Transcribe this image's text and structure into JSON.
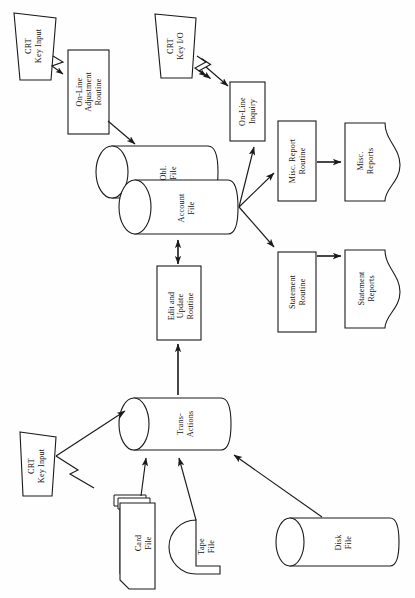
{
  "diagram": {
    "orientation": "landscape-rotated",
    "background_color": "#fefefe",
    "line_color": "#1a1a1a",
    "fill_color": "#ffffff",
    "nodes": [
      {
        "id": "crt_key_input_top",
        "label": "CRT\nKey Input",
        "symbol": "manual-input-trapezoid"
      },
      {
        "id": "online_adjustment",
        "label": "On-Line\nAdjustment\nRoutine",
        "symbol": "process-rectangle"
      },
      {
        "id": "crt_key_io",
        "label": "CRT\nKey I/O",
        "symbol": "manual-input-trapezoid"
      },
      {
        "id": "online_inquiry",
        "label": "On-Line\nInquiry",
        "symbol": "process-rectangle"
      },
      {
        "id": "obl_file",
        "label": "Obl.\nFile",
        "symbol": "direct-access-cylinder"
      },
      {
        "id": "account_file",
        "label": "Account\nFile",
        "symbol": "direct-access-cylinder"
      },
      {
        "id": "misc_report_routine",
        "label": "Misc. Report\nRoutine",
        "symbol": "process-rectangle"
      },
      {
        "id": "misc_reports",
        "label": "Misc.\nReports",
        "symbol": "document"
      },
      {
        "id": "statement_routine",
        "label": "Statement\nRoutine",
        "symbol": "process-rectangle"
      },
      {
        "id": "statement_reports",
        "label": "Statement\nReports",
        "symbol": "document"
      },
      {
        "id": "edit_update",
        "label": "Edit and\nUpdate\nRoutine",
        "symbol": "process-rectangle"
      },
      {
        "id": "transactions",
        "label": "Trans-\nActions",
        "symbol": "direct-access-cylinder"
      },
      {
        "id": "crt_key_input_bottom",
        "label": "CRT\nKey Input",
        "symbol": "manual-input-trapezoid"
      },
      {
        "id": "card_file",
        "label": "Card\nFile",
        "symbol": "punched-card-deck"
      },
      {
        "id": "tape_file",
        "label": "Tape\nFile",
        "symbol": "magnetic-tape-reel"
      },
      {
        "id": "disk_file",
        "label": "Disk\nFile",
        "symbol": "direct-access-cylinder"
      }
    ],
    "edges": [
      {
        "from": "crt_key_input_top",
        "to": "online_adjustment",
        "style": "communication-link",
        "arrow": "single"
      },
      {
        "from": "online_adjustment",
        "to": "obl_file",
        "style": "solid",
        "arrow": "single"
      },
      {
        "from": "crt_key_io",
        "to": "online_inquiry",
        "style": "communication-link",
        "arrow": "double"
      },
      {
        "from": "account_file",
        "to": "online_inquiry",
        "style": "solid",
        "arrow": "single"
      },
      {
        "from": "account_file",
        "to": "misc_report_routine",
        "style": "solid",
        "arrow": "single"
      },
      {
        "from": "account_file",
        "to": "statement_routine",
        "style": "solid",
        "arrow": "single"
      },
      {
        "from": "misc_report_routine",
        "to": "misc_reports",
        "style": "solid",
        "arrow": "single"
      },
      {
        "from": "statement_routine",
        "to": "statement_reports",
        "style": "solid",
        "arrow": "single"
      },
      {
        "from": "edit_update",
        "to": "account_file",
        "style": "solid",
        "arrow": "double"
      },
      {
        "from": "transactions",
        "to": "edit_update",
        "style": "solid",
        "arrow": "single"
      },
      {
        "from": "crt_key_input_bottom",
        "to": "transactions",
        "style": "communication-link",
        "arrow": "single"
      },
      {
        "from": "card_file",
        "to": "transactions",
        "style": "solid",
        "arrow": "single"
      },
      {
        "from": "tape_file",
        "to": "transactions",
        "style": "solid",
        "arrow": "single"
      },
      {
        "from": "disk_file",
        "to": "transactions",
        "style": "solid",
        "arrow": "single"
      }
    ]
  }
}
